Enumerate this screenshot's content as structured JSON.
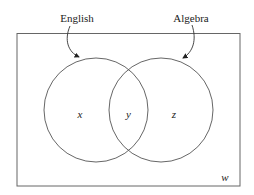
{
  "diagram": {
    "type": "venn",
    "universe": {
      "label": "w"
    },
    "sets": [
      {
        "name": "English",
        "region_label": "x"
      },
      {
        "name": "Algebra",
        "region_label": "z"
      }
    ],
    "intersection": {
      "label": "y"
    }
  },
  "colors": {
    "stroke": "#555555",
    "text": "#222222",
    "background": "#ffffff"
  }
}
